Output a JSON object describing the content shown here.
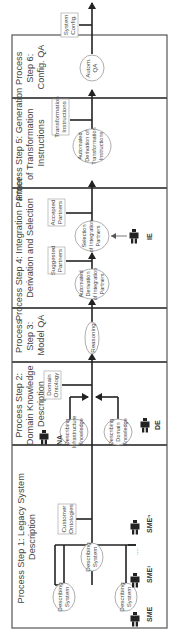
{
  "diagram": {
    "type": "process-flow",
    "orientation": "rotated-90-ccw",
    "colors": {
      "frame": "#555555",
      "flow": "#222222",
      "ellipse_stroke": "#999999",
      "text": "#444444"
    },
    "steps": [
      {
        "id": "step1",
        "title_lines": [
          "Process Step 1: Legacy System",
          "Description"
        ],
        "activities": [
          {
            "label_lines": [
              "Describing",
              "System"
            ]
          },
          {
            "label_lines": [
              "Describing",
              "System"
            ]
          },
          {
            "label_lines": [
              "Describing",
              "System"
            ]
          }
        ],
        "actors": [
          "SME",
          "SME¹",
          "SMEⁿ"
        ],
        "ellipsis": "....",
        "artifact_lines": [
          "Customer",
          "Ontologies"
        ]
      },
      {
        "id": "step2",
        "title_lines": [
          "Process Step 2:",
          "Domain Knowledge",
          "Description"
        ],
        "activities": [
          {
            "label_lines": [
              "Describing",
              "Infrastructure",
              "Knowledge"
            ]
          },
          {
            "label_lines": [
              "Describing",
              "Domain",
              "Knowledge"
            ]
          }
        ],
        "actors": [
          "NA",
          "DE"
        ],
        "artifact_lines": [
          "Domain",
          "Ontology"
        ]
      },
      {
        "id": "step3",
        "title_lines": [
          "Process",
          "Step 3:",
          "Model QA"
        ],
        "activities": [
          {
            "label_lines": [
              "Reasoning"
            ]
          }
        ]
      },
      {
        "id": "step4",
        "title_lines": [
          "Process Step 4: Integration Partner",
          "Derivation and Selection"
        ],
        "activities": [
          {
            "label_lines": [
              "Automated",
              "Derivation",
              "of Integration",
              "Partners"
            ]
          },
          {
            "label_lines": [
              "Selection",
              "of Integration",
              "Partners"
            ]
          }
        ],
        "actors": [
          "IE"
        ],
        "artifacts": [
          {
            "label_lines": [
              "Suggested",
              "Partners"
            ]
          },
          {
            "label_lines": [
              "Accepted",
              "Partners"
            ]
          }
        ]
      },
      {
        "id": "step5",
        "title_lines": [
          "Process Step 5: Generation",
          "of Transformation",
          "Instructions"
        ],
        "activities": [
          {
            "label_lines": [
              "Automated",
              "Derivation of",
              "Transformation",
              "Instructions"
            ]
          }
        ],
        "artifact_lines": [
          "Transformation",
          "Instructions"
        ]
      },
      {
        "id": "step6",
        "title_lines": [
          "Process",
          "Step 6:",
          "Config. QA"
        ],
        "activities": [
          {
            "label_lines": [
              "Autom.",
              "QA"
            ]
          }
        ],
        "output_lines": [
          "System",
          "Config."
        ]
      }
    ]
  }
}
